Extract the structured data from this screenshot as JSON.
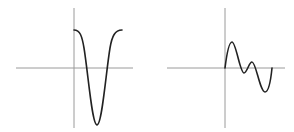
{
  "colors": {
    "background": "#ffffff",
    "axis": "#9a9a9a",
    "curve": "#222222"
  },
  "panels": [
    {
      "name": "left-plot",
      "description": "Deep single-well curve (inverted bell) starting at positive value, dipping far below the x-axis and returning",
      "axes": {
        "x_axis": {
          "x1": 16,
          "x2": 133,
          "y": 68
        },
        "y_axis": {
          "x": 74,
          "y1": 8,
          "y2": 128
        }
      },
      "curve_path": "M74,30 C80,30 82,36 84,48 C88,72 92,125 97,125 C102,125 106,72 110,48 C112,36 115,30 122,30"
    },
    {
      "name": "right-plot",
      "description": "Oscillating curve starting at origin: rises to a peak, dips slightly below axis, small bump above, deeper trough, then returns to axis",
      "axes": {
        "x_axis": {
          "x1": 167,
          "x2": 285,
          "y": 68
        },
        "y_axis": {
          "x": 225,
          "y1": 8,
          "y2": 128
        }
      },
      "curve_path": "M225,68 C227,52 229,42 232,42 C236,42 240,73 244,73 C247,73 249,62 252,62 C256,62 260,92 265,92 C269,92 271,78 272,68"
    }
  ]
}
